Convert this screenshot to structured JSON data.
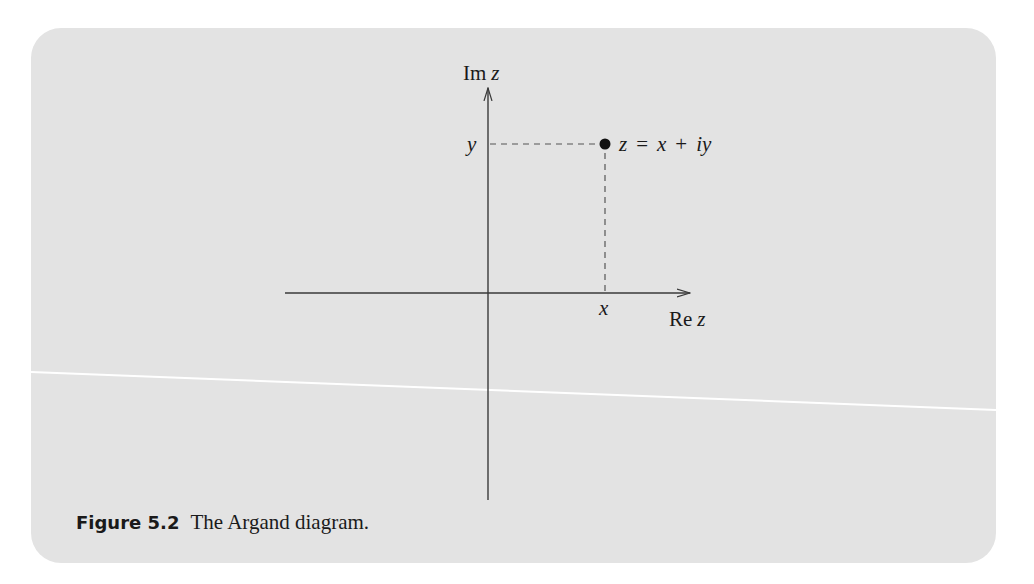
{
  "figure": {
    "label": "Figure 5.2",
    "caption": "The Argand diagram.",
    "background": "#e3e3e3"
  },
  "axes": {
    "imaginary_label_prefix": "Im",
    "imaginary_label_var": "z",
    "real_label_prefix": "Re",
    "real_label_var": "z"
  },
  "point": {
    "x_label": "x",
    "y_label": "y",
    "equation_lhs": "z",
    "equation_eq": "=",
    "equation_x": "x",
    "equation_plus": "+",
    "equation_iy": "iy"
  },
  "colors": {
    "axis": "#3a3a3a",
    "dash": "#555555",
    "point": "#111111",
    "scan_line": "#ffffff"
  }
}
